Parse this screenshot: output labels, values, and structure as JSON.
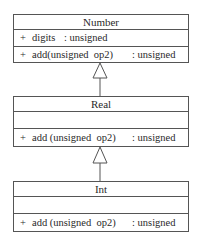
{
  "diagram": {
    "type": "UML class diagram - inheritance chain",
    "classes": [
      {
        "name": "Number",
        "attributes": [
          {
            "visibility": "+",
            "name": "digits",
            "type": ": unsigned"
          }
        ],
        "operations": [
          {
            "visibility": "+",
            "signature": "add(unsigned  op2)",
            "type": ": unsigned"
          }
        ]
      },
      {
        "name": "Real",
        "attributes": [],
        "operations": [
          {
            "visibility": "+",
            "signature": "add (unsigned  op2)",
            "type": ": unsigned"
          }
        ]
      },
      {
        "name": "Int",
        "attributes": [],
        "operations": [
          {
            "visibility": "+",
            "signature": "add (unsigned  op2)",
            "type": ": unsigned"
          }
        ]
      }
    ],
    "relationships": [
      {
        "kind": "generalization",
        "from": "Real",
        "to": "Number"
      },
      {
        "kind": "generalization",
        "from": "Int",
        "to": "Real"
      }
    ],
    "colors": {
      "line": "#555555",
      "text": "#2a2a2a",
      "background": "#ffffff"
    }
  }
}
